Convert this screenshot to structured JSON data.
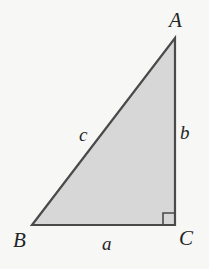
{
  "figure": {
    "kind": "right-triangle-diagram",
    "background_color": "#f7f7f6",
    "fill_color": "#d7d7d7",
    "stroke_color": "#4a4a4a",
    "label_color": "#242424",
    "vertices": {
      "a": {
        "label": "A",
        "x": 175,
        "y": 38
      },
      "b": {
        "label": "B",
        "x": 32,
        "y": 225
      },
      "c": {
        "label": "C",
        "x": 175,
        "y": 225
      }
    },
    "sides": {
      "a": {
        "label": "a",
        "between": "B-C"
      },
      "b": {
        "label": "b",
        "between": "A-C"
      },
      "c": {
        "label": "c",
        "between": "A-B"
      }
    },
    "right_angle": {
      "at_vertex": "C",
      "marker": "square",
      "size": 12
    }
  }
}
